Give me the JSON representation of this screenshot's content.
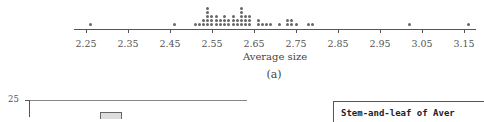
{
  "chart_data": [
    {
      "type": "scatter",
      "subtype": "dotplot",
      "panel_label": "(a)",
      "title": "",
      "xlabel": "Average size",
      "ylabel": "",
      "xlim": [
        2.22,
        3.18
      ],
      "x_ticks": [
        2.25,
        2.35,
        2.45,
        2.55,
        2.65,
        2.75,
        2.85,
        2.95,
        3.05,
        3.15
      ],
      "x_tick_labels": [
        "2.25",
        "2.35",
        "2.45",
        "2.55",
        "2.65",
        "2.75",
        "2.85",
        "2.95",
        "3.05",
        "3.15"
      ],
      "grid": false,
      "stacks": [
        {
          "x": 2.26,
          "count": 1
        },
        {
          "x": 2.46,
          "count": 1
        },
        {
          "x": 2.51,
          "count": 1
        },
        {
          "x": 2.52,
          "count": 1
        },
        {
          "x": 2.53,
          "count": 2
        },
        {
          "x": 2.54,
          "count": 5
        },
        {
          "x": 2.55,
          "count": 3
        },
        {
          "x": 2.56,
          "count": 3
        },
        {
          "x": 2.57,
          "count": 2
        },
        {
          "x": 2.58,
          "count": 3
        },
        {
          "x": 2.59,
          "count": 2
        },
        {
          "x": 2.6,
          "count": 3
        },
        {
          "x": 2.61,
          "count": 2
        },
        {
          "x": 2.62,
          "count": 5
        },
        {
          "x": 2.63,
          "count": 3
        },
        {
          "x": 2.64,
          "count": 3
        },
        {
          "x": 2.66,
          "count": 2
        },
        {
          "x": 2.67,
          "count": 1
        },
        {
          "x": 2.68,
          "count": 1
        },
        {
          "x": 2.69,
          "count": 1
        },
        {
          "x": 2.71,
          "count": 1
        },
        {
          "x": 2.73,
          "count": 2
        },
        {
          "x": 2.74,
          "count": 2
        },
        {
          "x": 2.75,
          "count": 1
        },
        {
          "x": 2.78,
          "count": 1
        },
        {
          "x": 2.79,
          "count": 1
        },
        {
          "x": 3.02,
          "count": 1
        },
        {
          "x": 3.16,
          "count": 1
        }
      ]
    },
    {
      "type": "bar",
      "subtype": "histogram",
      "title": "",
      "xlabel": "",
      "ylabel": "",
      "y_tick_labels_visible": [
        "25"
      ],
      "ylim_top": 25,
      "visible_bars": [
        {
          "position": "partial",
          "height": "~24 (cropped)"
        }
      ]
    }
  ],
  "stem_and_leaf": {
    "title": "Stem-and-leaf of Aver"
  },
  "colors": {
    "dot": "#666666",
    "axis": "#555555",
    "bar_fill": "#dddddd",
    "bar_edge": "#666666"
  }
}
